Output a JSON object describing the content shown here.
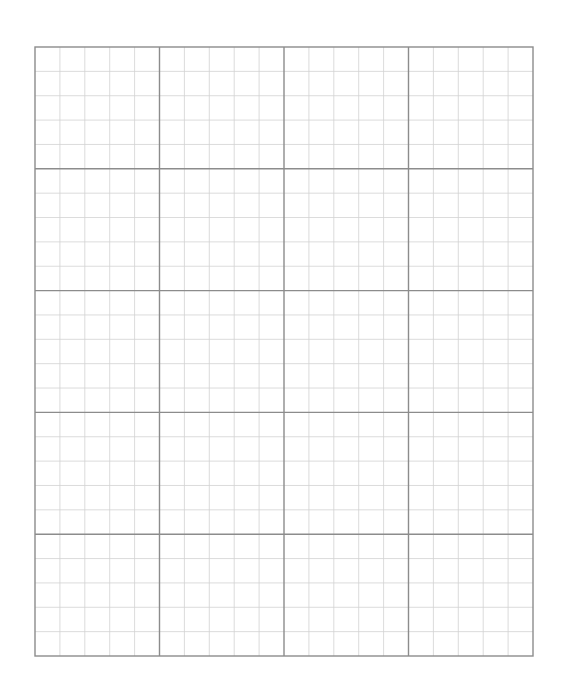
{
  "page": {
    "width": 566,
    "height": 692,
    "background": "#ffffff"
  },
  "grid": {
    "left": 35,
    "top": 47,
    "right": 533,
    "bottom": 656,
    "major_columns": 4,
    "major_rows": 5,
    "minor_subdivisions": 5,
    "major_line_color": "#8c8c8c",
    "minor_line_color": "#d2d2d2",
    "major_line_width": 1.4,
    "minor_line_width": 0.8
  }
}
